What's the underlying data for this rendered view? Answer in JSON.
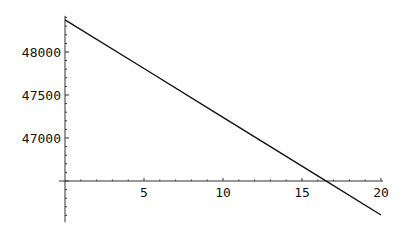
{
  "chart_data": {
    "type": "line",
    "title": "",
    "xlabel": "",
    "ylabel": "",
    "xlim": [
      0,
      20
    ],
    "ylim": [
      46020,
      48420
    ],
    "x_axis_crossing_y": 46500,
    "grid": false,
    "legend": null,
    "x_ticks": [
      5,
      10,
      15,
      20
    ],
    "x_tick_labels": [
      "5",
      "10",
      "15",
      "20"
    ],
    "y_ticks": [
      47000,
      47500,
      48000
    ],
    "y_tick_labels": [
      "47000",
      "47500",
      "48000"
    ],
    "series": [
      {
        "name": "line",
        "color": "#111111",
        "x": [
          0,
          5,
          10,
          15,
          16.2,
          20
        ],
        "y": [
          48375,
          47808,
          47240,
          46673,
          46537,
          46105
        ]
      }
    ]
  }
}
